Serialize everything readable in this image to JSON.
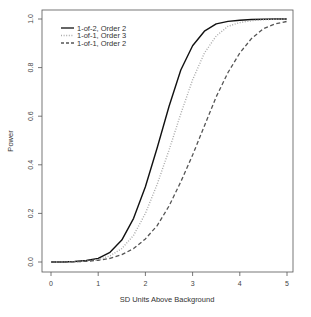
{
  "chart_data": {
    "type": "line",
    "title": "",
    "xlabel": "SD Units Above Background",
    "ylabel": "Power",
    "xlim": [
      0,
      5
    ],
    "ylim": [
      0,
      1
    ],
    "xticks": [
      0,
      1,
      2,
      3,
      4,
      5
    ],
    "xtick_labels": [
      "0",
      "1",
      "2",
      "3",
      "4",
      "5"
    ],
    "yticks": [
      0,
      0.2,
      0.4,
      0.6,
      0.8,
      1.0
    ],
    "ytick_labels": [
      "0.0",
      "0.2",
      "0.4",
      "0.6",
      "0.8",
      "1.0"
    ],
    "grid": false,
    "legend_position": "top-left",
    "x": [
      0,
      0.25,
      0.5,
      0.75,
      1.0,
      1.25,
      1.5,
      1.75,
      2.0,
      2.25,
      2.5,
      2.75,
      3.0,
      3.25,
      3.5,
      3.75,
      4.0,
      4.25,
      4.5,
      4.75,
      5.0
    ],
    "series": [
      {
        "name": "1-of-2, Order 2",
        "style": "solid",
        "color": "#111111",
        "values": [
          0.0,
          0.0,
          0.002,
          0.006,
          0.015,
          0.04,
          0.09,
          0.18,
          0.31,
          0.47,
          0.64,
          0.79,
          0.89,
          0.95,
          0.98,
          0.99,
          0.995,
          0.998,
          0.999,
          1.0,
          1.0
        ]
      },
      {
        "name": "1-of-1, Order 3",
        "style": "dotted",
        "color": "#aaaaaa",
        "values": [
          0.0,
          0.0,
          0.001,
          0.004,
          0.01,
          0.025,
          0.055,
          0.11,
          0.2,
          0.32,
          0.46,
          0.61,
          0.75,
          0.86,
          0.93,
          0.97,
          0.985,
          0.993,
          0.997,
          0.999,
          1.0
        ]
      },
      {
        "name": "1-of-1, Order 2",
        "style": "dashed",
        "color": "#555555",
        "values": [
          0.0,
          0.0,
          0.001,
          0.003,
          0.007,
          0.015,
          0.03,
          0.055,
          0.095,
          0.15,
          0.23,
          0.33,
          0.44,
          0.56,
          0.68,
          0.78,
          0.86,
          0.92,
          0.96,
          0.98,
          0.99
        ]
      }
    ]
  },
  "legend": {
    "items": [
      {
        "label": "1-of-2, Order 2"
      },
      {
        "label": "1-of-1, Order 3"
      },
      {
        "label": "1-of-1, Order 2"
      }
    ]
  },
  "axes": {
    "xlabel": "SD Units Above Background",
    "ylabel": "Power",
    "xtick_labels": [
      "0",
      "1",
      "2",
      "3",
      "4",
      "5"
    ],
    "ytick_labels": [
      "0.0",
      "0.2",
      "0.4",
      "0.6",
      "0.8",
      "1.0"
    ]
  }
}
